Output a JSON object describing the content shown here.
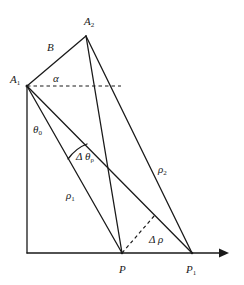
{
  "diagram": {
    "type": "geometry-ray-diagram",
    "colors": {
      "stroke": "#1a1a1a",
      "background": "#ffffff"
    },
    "points": {
      "A1": {
        "x": 27,
        "y": 86,
        "label": "A",
        "sub": "1"
      },
      "A2": {
        "x": 86,
        "y": 36,
        "label": "A",
        "sub": "2"
      },
      "O": {
        "x": 27,
        "y": 253
      },
      "P": {
        "x": 122,
        "y": 253,
        "label": "P",
        "sub": ""
      },
      "P1": {
        "x": 192,
        "y": 253,
        "label": "P",
        "sub": "1"
      },
      "D": {
        "x": 155,
        "y": 215
      }
    },
    "labels": {
      "B": "B",
      "alpha": "α",
      "theta0": "θ",
      "theta0_sub": "0",
      "delta_theta": "Δ θ",
      "delta_theta_sub": "ρ",
      "rho1": "ρ",
      "rho1_sub": "1",
      "rho2": "ρ",
      "rho2_sub": "2",
      "delta_rho": "Δ ρ",
      "A1": "A",
      "A1_sub": "1",
      "A2": "A",
      "A2_sub": "2",
      "P": "P",
      "P1": "P",
      "P1_sub": "1"
    },
    "segments": [
      {
        "name": "A1-A2 (B)",
        "style": "solid"
      },
      {
        "name": "A1-O vertical axis",
        "style": "solid"
      },
      {
        "name": "O-x axis arrow",
        "style": "solid"
      },
      {
        "name": "A1-P (rho1)",
        "style": "solid"
      },
      {
        "name": "A1-P1",
        "style": "solid"
      },
      {
        "name": "A2-P",
        "style": "solid"
      },
      {
        "name": "A2-P1 (rho2)",
        "style": "solid"
      },
      {
        "name": "A1 horizontal (alpha)",
        "style": "dashed"
      },
      {
        "name": "P-D perpendicular (delta rho)",
        "style": "dashed"
      },
      {
        "name": "arc delta theta",
        "style": "solid"
      }
    ]
  }
}
